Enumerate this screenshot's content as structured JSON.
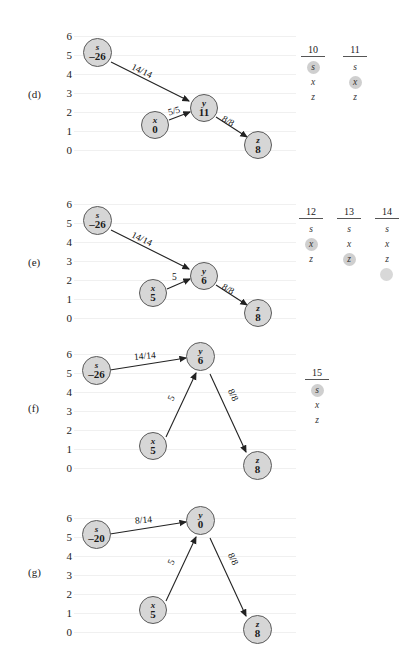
{
  "figure": {
    "caption_labels": [
      "(d)",
      "(e)",
      "(f)",
      "(g)"
    ],
    "axis_ticks": [
      "6",
      "5",
      "4",
      "3",
      "2",
      "1",
      "0"
    ],
    "node_fill": "#d6d6d6",
    "node_stroke": "#5a5a5a",
    "highlight_color": "#cfcfcf"
  },
  "panels": [
    {
      "id": "d",
      "label": "(d)",
      "nodes": [
        {
          "name": "s",
          "value": "–26",
          "level": 5
        },
        {
          "name": "x",
          "value": "0",
          "level": 1
        },
        {
          "name": "y",
          "value": "11",
          "level": 2
        },
        {
          "name": "z",
          "value": "8",
          "level": 0
        }
      ],
      "edges": [
        {
          "from": "s",
          "to": "y",
          "label": "14/14"
        },
        {
          "from": "x",
          "to": "y",
          "label": "5/5"
        },
        {
          "from": "y",
          "to": "z",
          "label": "8/8"
        }
      ],
      "table": {
        "headers": [
          "10",
          "11"
        ],
        "rows": [
          [
            {
              "text": "s",
              "highlight": true
            },
            {
              "text": "s",
              "highlight": false
            }
          ],
          [
            {
              "text": "x",
              "highlight": false
            },
            {
              "text": "x",
              "highlight": true
            }
          ],
          [
            {
              "text": "z",
              "highlight": false
            },
            {
              "text": "z",
              "highlight": false
            }
          ]
        ]
      }
    },
    {
      "id": "e",
      "label": "(e)",
      "nodes": [
        {
          "name": "s",
          "value": "–26",
          "level": 5
        },
        {
          "name": "x",
          "value": "5",
          "level": 1
        },
        {
          "name": "y",
          "value": "6",
          "level": 2
        },
        {
          "name": "z",
          "value": "8",
          "level": 0
        }
      ],
      "edges": [
        {
          "from": "s",
          "to": "y",
          "label": "14/14"
        },
        {
          "from": "x",
          "to": "y",
          "label": "5"
        },
        {
          "from": "y",
          "to": "z",
          "label": "8/8"
        }
      ],
      "table": {
        "headers": [
          "12",
          "13",
          "14"
        ],
        "rows": [
          [
            {
              "text": "s",
              "highlight": false
            },
            {
              "text": "s",
              "highlight": false
            },
            {
              "text": "s",
              "highlight": false
            }
          ],
          [
            {
              "text": "x",
              "highlight": true
            },
            {
              "text": "x",
              "highlight": false
            },
            {
              "text": "x",
              "highlight": false
            }
          ],
          [
            {
              "text": "z",
              "highlight": false
            },
            {
              "text": "z",
              "highlight": true
            },
            {
              "text": "z",
              "highlight": false
            }
          ],
          [
            {
              "text": "",
              "highlight": false
            },
            {
              "text": "",
              "highlight": false
            },
            {
              "text": "",
              "highlight": true
            }
          ]
        ]
      }
    },
    {
      "id": "f",
      "label": "(f)",
      "nodes": [
        {
          "name": "s",
          "value": "–26",
          "level": 5
        },
        {
          "name": "x",
          "value": "5",
          "level": 1
        },
        {
          "name": "y",
          "value": "6",
          "level": 6
        },
        {
          "name": "z",
          "value": "8",
          "level": 0
        }
      ],
      "edges": [
        {
          "from": "s",
          "to": "y",
          "label": "14/14"
        },
        {
          "from": "x",
          "to": "y",
          "label": "5"
        },
        {
          "from": "y",
          "to": "z",
          "label": "8/8"
        }
      ],
      "table": {
        "headers": [
          "15"
        ],
        "rows": [
          [
            {
              "text": "s",
              "highlight": true
            }
          ],
          [
            {
              "text": "x",
              "highlight": false
            }
          ],
          [
            {
              "text": "z",
              "highlight": false
            }
          ]
        ]
      }
    },
    {
      "id": "g",
      "label": "(g)",
      "nodes": [
        {
          "name": "s",
          "value": "–20",
          "level": 5
        },
        {
          "name": "x",
          "value": "5",
          "level": 1
        },
        {
          "name": "y",
          "value": "0",
          "level": 6
        },
        {
          "name": "z",
          "value": "8",
          "level": 0
        }
      ],
      "edges": [
        {
          "from": "s",
          "to": "y",
          "label": "8/14"
        },
        {
          "from": "x",
          "to": "y",
          "label": "5"
        },
        {
          "from": "y",
          "to": "z",
          "label": "8/8"
        }
      ],
      "table": {
        "headers": [],
        "rows": []
      }
    }
  ]
}
